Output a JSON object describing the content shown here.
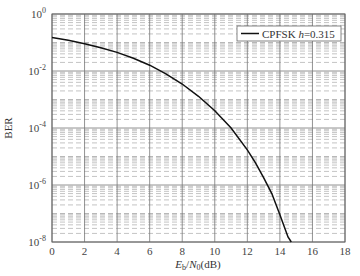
{
  "chart_data": {
    "type": "line",
    "title": "",
    "xlabel": "Eb/N0(dB)",
    "xlabel_parts": {
      "E": "E",
      "b": "b",
      "slash": "/",
      "N": "N",
      "zero": "0",
      "unit": "(dB)"
    },
    "ylabel": "BER",
    "xlim": [
      0,
      18
    ],
    "ylim": [
      1e-08,
      1
    ],
    "yscale": "log",
    "grid": true,
    "x_ticks": [
      "0",
      "2",
      "4",
      "6",
      "8",
      "10",
      "12",
      "14",
      "16",
      "18"
    ],
    "y_ticks": [
      {
        "base": "10",
        "exp": "0",
        "value": 1
      },
      {
        "base": "10",
        "exp": "-2",
        "value": 0.01
      },
      {
        "base": "10",
        "exp": "-4",
        "value": 0.0001
      },
      {
        "base": "10",
        "exp": "-6",
        "value": 1e-06
      },
      {
        "base": "10",
        "exp": "-8",
        "value": 1e-08
      }
    ],
    "legend": {
      "position": "upper right",
      "entries": [
        "CPFSK h=0.315"
      ]
    },
    "legend_parts": {
      "prefix": "CPFSK ",
      "h": "h",
      "suffix": "=0.315"
    },
    "series": [
      {
        "name": "CPFSK h=0.315",
        "color": "#111111",
        "x": [
          0,
          1,
          2,
          3,
          4,
          5,
          6,
          7,
          8,
          9,
          10,
          11,
          12,
          12.5,
          13,
          13.5,
          14,
          14.5,
          14.7
        ],
        "y": [
          0.15,
          0.12,
          0.09,
          0.065,
          0.045,
          0.028,
          0.016,
          0.008,
          0.0035,
          0.0013,
          0.0004,
          0.0001,
          1.7e-05,
          6e-06,
          1.8e-06,
          5e-07,
          9e-08,
          1.5e-08,
          1e-08
        ]
      }
    ]
  }
}
